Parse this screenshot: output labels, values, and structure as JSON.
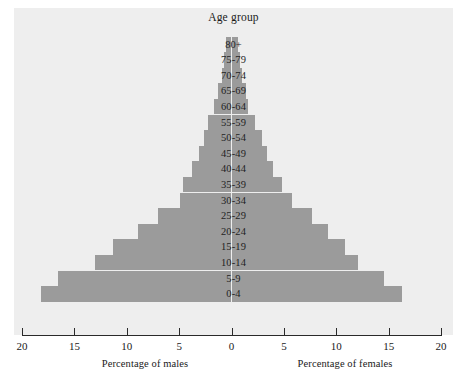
{
  "chart_data": {
    "type": "bar",
    "subtype": "population-pyramid",
    "title": "Age group",
    "xlabel_left": "Percentage of males",
    "xlabel_right": "Percentage of females",
    "ylabel": "Age group",
    "grid": false,
    "legend": "none",
    "xlim": [
      -20,
      20
    ],
    "xticks": [
      20,
      15,
      10,
      5,
      0,
      5,
      10,
      15,
      20
    ],
    "xtick_labels": [
      "20",
      "15",
      "10",
      "5",
      "0",
      "5",
      "10",
      "15",
      "20"
    ],
    "categories": [
      "80+",
      "75-79",
      "70-74",
      "65-69",
      "60-64",
      "55-59",
      "50-54",
      "45-49",
      "40-44",
      "35-39",
      "30-34",
      "25-29",
      "20-24",
      "15-19",
      "10-14",
      "5-9",
      "0-4"
    ],
    "series": [
      {
        "name": "Percentage of males",
        "side": "left",
        "values": [
          0.5,
          0.7,
          0.9,
          1.3,
          1.7,
          2.2,
          2.6,
          3.1,
          3.8,
          4.6,
          4.9,
          7.0,
          8.9,
          11.3,
          13.0,
          16.6,
          18.2
        ]
      },
      {
        "name": "Percentage of females",
        "side": "right",
        "values": [
          0.6,
          0.8,
          1.0,
          1.4,
          1.6,
          2.2,
          2.9,
          3.4,
          4.0,
          4.8,
          5.8,
          7.7,
          9.2,
          10.8,
          12.1,
          14.6,
          16.3
        ]
      }
    ]
  },
  "colors": {
    "bar": "#9b9b9b",
    "panel": "#eeeeee",
    "axis": "#2a2a2a",
    "text": "#1a1a1a",
    "page": "#ffffff"
  }
}
